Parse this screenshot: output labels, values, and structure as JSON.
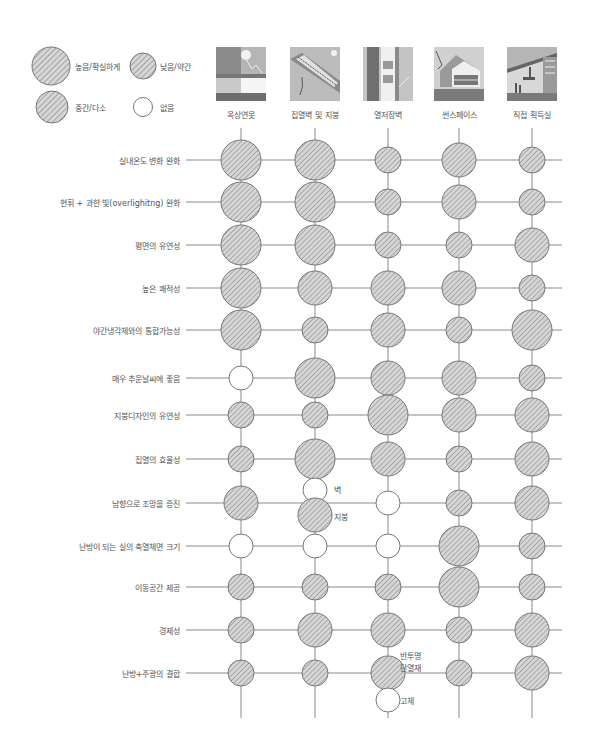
{
  "legend": [
    {
      "level": "L",
      "label": "높음/확실하게"
    },
    {
      "level": "S",
      "label": "낮음/약간"
    },
    {
      "level": "M",
      "label": "중간/다소"
    },
    {
      "level": "N",
      "label": "없음"
    }
  ],
  "columns": [
    {
      "label": "옥상연못",
      "thumbnail": "roof-pond-image"
    },
    {
      "label": "집열벽 및 지붕",
      "thumbnail": "collector-wall-roof-image"
    },
    {
      "label": "열저장벽",
      "thumbnail": "thermal-storage-wall-image"
    },
    {
      "label": "썬스페이스",
      "thumbnail": "sunspace-image"
    },
    {
      "label": "직접 획득실",
      "thumbnail": "direct-gain-image"
    }
  ],
  "rows": [
    {
      "label": "실내온도 변화 완화",
      "values": [
        "L",
        "L",
        "S",
        "M",
        "S"
      ]
    },
    {
      "label": "현휘 + 과한 빛(overlighitng) 완화",
      "values": [
        "L",
        "L",
        "S",
        "M",
        "S"
      ]
    },
    {
      "label": "평면의 유연성",
      "values": [
        "L",
        "L",
        "S",
        "S",
        "M"
      ]
    },
    {
      "label": "높은 쾌적성",
      "values": [
        "L",
        "M",
        "M",
        "M",
        "S"
      ]
    },
    {
      "label": "야간냉각체와의 통합가능성",
      "values": [
        "L",
        "S",
        "M",
        "S",
        "L"
      ]
    },
    {
      "label": "매우 추운날씨에 좋음",
      "values": [
        "N",
        "L",
        "M",
        "M",
        "S"
      ]
    },
    {
      "label": "지붕디자인의 유연성",
      "values": [
        "S",
        "S",
        "L",
        "M",
        "M"
      ]
    },
    {
      "label": "집열의 효율성",
      "values": [
        "S",
        "L",
        "M",
        "S",
        "M"
      ]
    },
    {
      "label": "남향으로 조망을 증진",
      "values": [
        "M",
        "N|M",
        "N",
        "S",
        "M"
      ]
    },
    {
      "label": "난방이 되는 실의 축열체면 크기",
      "values": [
        "N",
        "N",
        "N",
        "L",
        "S"
      ]
    },
    {
      "label": "이동공간 제공",
      "values": [
        "S",
        "S",
        "S",
        "L",
        "S"
      ]
    },
    {
      "label": "경제성",
      "values": [
        "S",
        "M",
        "M",
        "S",
        "M"
      ]
    },
    {
      "label": "난방+주광의 결합",
      "values": [
        "S",
        "S",
        "M|N",
        "S",
        "M"
      ]
    }
  ],
  "annotations": {
    "wall": "벽",
    "roof": "지붕",
    "translucent_line1": "반투명",
    "translucent_line2": "단열재",
    "solid": "고체"
  },
  "colors": {
    "line": "#8a8a8a",
    "fill": "#d4d4d4",
    "hatch": "#7a7a7a",
    "outline": "#777777",
    "text": "#555555"
  }
}
